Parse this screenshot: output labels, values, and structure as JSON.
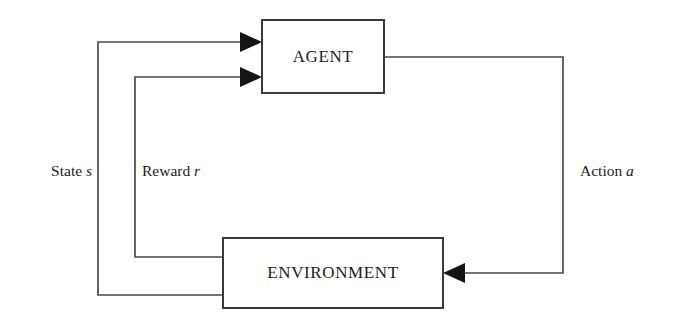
{
  "diagram": {
    "type": "cycle-block-diagram",
    "background_color": "#ffffff",
    "line_color": "#4a4a4a",
    "box_border_color": "#3a3a3a",
    "text_color": "#1c1c1c",
    "nodes": [
      {
        "id": "agent",
        "label": "AGENT",
        "shape": "rectangle",
        "x": 262,
        "y": 20,
        "width": 122,
        "height": 73
      },
      {
        "id": "environment",
        "label": "ENVIRONMENT",
        "shape": "rectangle",
        "x": 223,
        "y": 238,
        "width": 220,
        "height": 70
      }
    ],
    "edges": [
      {
        "id": "state-edge",
        "from": "environment",
        "to": "agent",
        "label_text": "State",
        "label_var": "s",
        "label_x": 92,
        "label_y": 172,
        "label_anchor": "end",
        "arrow_direction": "right",
        "path": "M 223 295 L 98 295 L 98 42 L 247 42"
      },
      {
        "id": "reward-edge",
        "from": "environment",
        "to": "agent",
        "label_text": "Reward",
        "label_var": "r",
        "label_x": 142,
        "label_y": 172,
        "label_anchor": "start",
        "arrow_direction": "right",
        "path": "M 223 257 L 135 257 L 135 77 L 247 77"
      },
      {
        "id": "action-edge",
        "from": "agent",
        "to": "environment",
        "label_text": "Action",
        "label_var": "a",
        "label_x": 580,
        "label_y": 172,
        "label_anchor": "start",
        "arrow_direction": "left",
        "path": "M 384 57 L 563 57 L 563 273 L 458 273"
      }
    ],
    "arrowheads": [
      {
        "id": "state-arrowhead",
        "x": 262,
        "y": 42,
        "direction": "right"
      },
      {
        "id": "reward-arrowhead",
        "x": 262,
        "y": 77,
        "direction": "right"
      },
      {
        "id": "action-arrowhead",
        "x": 443,
        "y": 273,
        "direction": "left"
      }
    ]
  }
}
